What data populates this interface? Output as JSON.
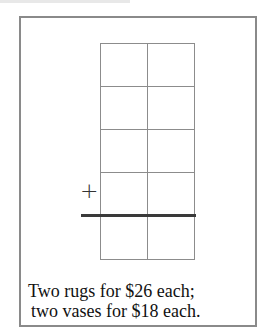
{
  "diagram": {
    "type": "addition-grid",
    "grid": {
      "rows": 5,
      "columns": 2,
      "sum_line_after_row": 4
    },
    "operator_symbol": "+",
    "caption": {
      "line1": "Two rugs for $26 each;",
      "line2": "two vases for $18 each."
    }
  }
}
